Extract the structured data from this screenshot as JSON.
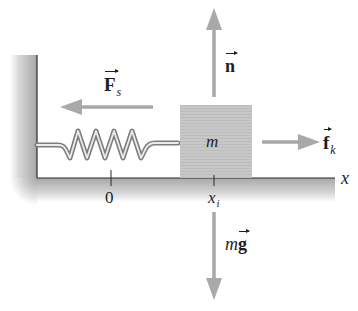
{
  "figure": {
    "type": "free-body diagram"
  },
  "block": {
    "label": "m"
  },
  "forces": {
    "normal": {
      "symbol": "n",
      "direction": "up"
    },
    "gravity": {
      "prefix": "m",
      "symbol": "g",
      "direction": "down"
    },
    "spring": {
      "symbol": "F",
      "subscript": "s",
      "direction": "left"
    },
    "friction": {
      "symbol": "f",
      "subscript": "k",
      "direction": "right"
    }
  },
  "axis": {
    "label": "x",
    "ticks": [
      {
        "label": "0",
        "subscript": ""
      },
      {
        "label": "x",
        "subscript": "i"
      }
    ]
  },
  "colors": {
    "arrow": "#a9a9a9",
    "block": "#c6c6c6",
    "surface_shade": "#bdbdbd",
    "edge_line": "#2a2a2a",
    "spring_outer": "#7d7d7d",
    "spring_inner": "#e8e8e8",
    "text": "#1e1e1e"
  }
}
